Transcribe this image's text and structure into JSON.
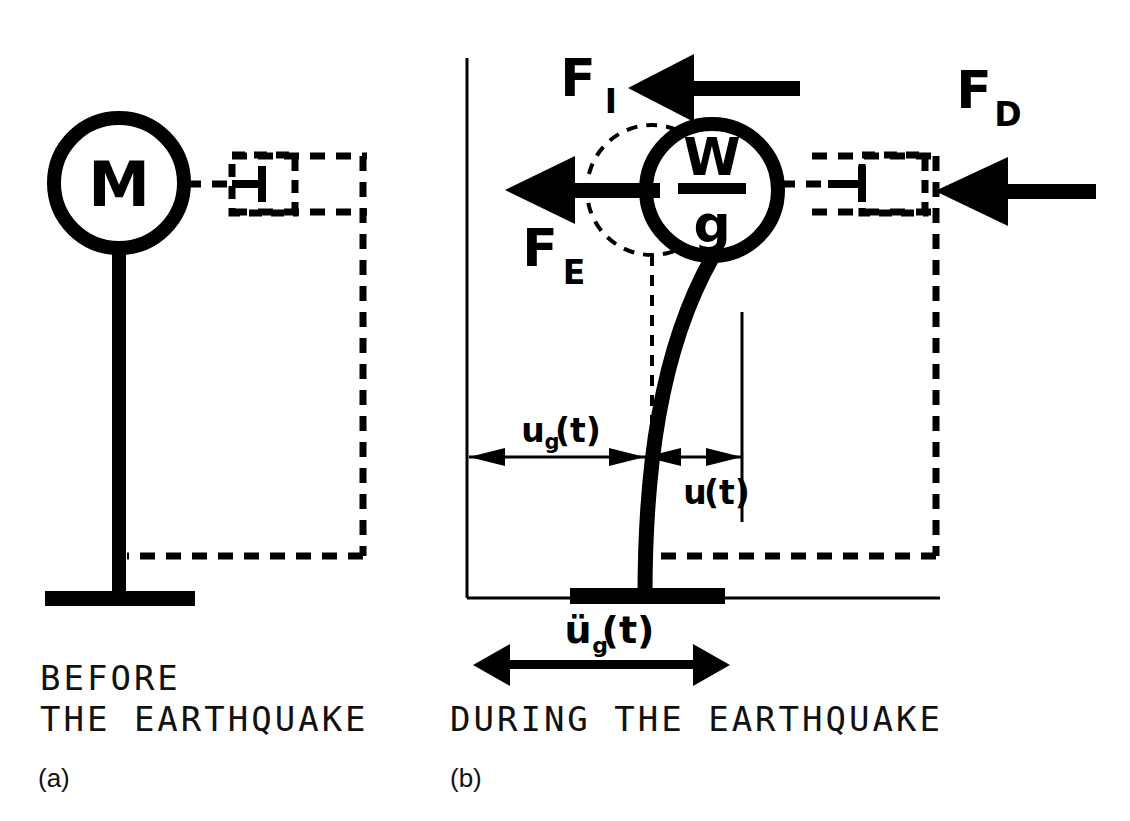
{
  "figure": {
    "background_color": "#ffffff",
    "ink_color": "#000000"
  },
  "panel_a": {
    "id": "(a)",
    "caption_line1": "BEFORE",
    "caption_line2": "THE EARTHQUAKE",
    "mass_label": "M",
    "elements": {
      "mass_circle": "mass-circle",
      "column": "vertical-column",
      "base_plate": "base-plate",
      "dashpot": "damper-dashpot",
      "reference_frame": "dashed-reference-frame"
    }
  },
  "panel_b": {
    "id": "(b)",
    "caption_line1": "DURING THE EARTHQUAKE",
    "mass_numerator": "W",
    "mass_denominator": "g",
    "forces": [
      {
        "key": "inertia",
        "symbol": "F",
        "subscript": "I",
        "direction": "left",
        "name": "inertia-force"
      },
      {
        "key": "elastic",
        "symbol": "F",
        "subscript": "E",
        "direction": "left",
        "name": "elastic-force"
      },
      {
        "key": "damping",
        "symbol": "F",
        "subscript": "D",
        "direction": "left",
        "name": "damping-force"
      }
    ],
    "dimensions": [
      {
        "key": "ground_disp",
        "symbol": "u",
        "subscript": "g",
        "argument": "(t)",
        "name": "ground-displacement"
      },
      {
        "key": "relative_disp",
        "symbol": "u",
        "subscript": "",
        "argument": "(t)",
        "name": "relative-displacement"
      },
      {
        "key": "ground_accel",
        "symbol": "ü",
        "subscript": "g",
        "argument": "(t)",
        "name": "ground-acceleration"
      }
    ],
    "elements": {
      "mass_circle": "deformed-mass-circle",
      "original_position_circle": "original-position-dashed-circle",
      "deformed_column": "deformed-column-curve",
      "base_plate": "base-plate",
      "dashpot": "damper-dashpot",
      "reference_frame": "dashed-reference-frame",
      "vertical_datum": "vertical-datum-line",
      "ground_line": "ground-line"
    }
  }
}
